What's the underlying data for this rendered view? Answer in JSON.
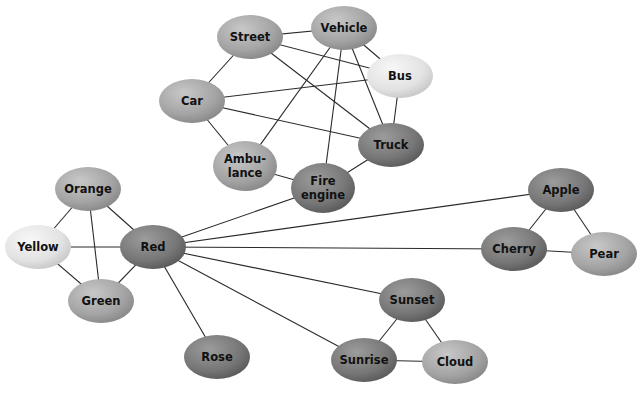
{
  "diagram": {
    "type": "network-graph",
    "shades": {
      "light": "#e4e4e4",
      "medium": "#a8a8a8",
      "dark": "#7a7a7a",
      "edge": "#2a2a2a"
    },
    "nodes": [
      {
        "id": "street",
        "label": [
          "Street"
        ],
        "x": 250,
        "y": 37,
        "shade": "medium"
      },
      {
        "id": "vehicle",
        "label": [
          "Vehicle"
        ],
        "x": 344,
        "y": 28,
        "shade": "medium"
      },
      {
        "id": "bus",
        "label": [
          "Bus"
        ],
        "x": 400,
        "y": 76,
        "shade": "light"
      },
      {
        "id": "car",
        "label": [
          "Car"
        ],
        "x": 192,
        "y": 101,
        "shade": "medium"
      },
      {
        "id": "truck",
        "label": [
          "Truck"
        ],
        "x": 391,
        "y": 145,
        "shade": "dark"
      },
      {
        "id": "ambulance",
        "label": [
          "Ambu-",
          "lance"
        ],
        "x": 245,
        "y": 166,
        "shade": "medium"
      },
      {
        "id": "fire-engine",
        "label": [
          "Fire",
          "engine"
        ],
        "x": 323,
        "y": 188,
        "shade": "dark"
      },
      {
        "id": "orange",
        "label": [
          "Orange"
        ],
        "x": 88,
        "y": 189,
        "shade": "medium"
      },
      {
        "id": "yellow",
        "label": [
          "Yellow"
        ],
        "x": 38,
        "y": 247,
        "shade": "light"
      },
      {
        "id": "red",
        "label": [
          "Red"
        ],
        "x": 153,
        "y": 247,
        "shade": "dark"
      },
      {
        "id": "green",
        "label": [
          "Green"
        ],
        "x": 101,
        "y": 301,
        "shade": "medium"
      },
      {
        "id": "rose",
        "label": [
          "Rose"
        ],
        "x": 217,
        "y": 357,
        "shade": "dark"
      },
      {
        "id": "apple",
        "label": [
          "Apple"
        ],
        "x": 561,
        "y": 190,
        "shade": "dark"
      },
      {
        "id": "cherry",
        "label": [
          "Cherry"
        ],
        "x": 514,
        "y": 249,
        "shade": "dark"
      },
      {
        "id": "pear",
        "label": [
          "Pear"
        ],
        "x": 604,
        "y": 254,
        "shade": "medium"
      },
      {
        "id": "sunset",
        "label": [
          "Sunset"
        ],
        "x": 412,
        "y": 300,
        "shade": "dark"
      },
      {
        "id": "sunrise",
        "label": [
          "Sunrise"
        ],
        "x": 364,
        "y": 360,
        "shade": "dark"
      },
      {
        "id": "cloud",
        "label": [
          "Cloud"
        ],
        "x": 455,
        "y": 362,
        "shade": "medium"
      }
    ],
    "edges": [
      [
        "street",
        "vehicle"
      ],
      [
        "street",
        "bus"
      ],
      [
        "street",
        "truck"
      ],
      [
        "street",
        "car"
      ],
      [
        "vehicle",
        "bus"
      ],
      [
        "vehicle",
        "truck"
      ],
      [
        "vehicle",
        "ambulance"
      ],
      [
        "vehicle",
        "fire-engine"
      ],
      [
        "car",
        "bus"
      ],
      [
        "car",
        "truck"
      ],
      [
        "car",
        "ambulance"
      ],
      [
        "bus",
        "truck"
      ],
      [
        "truck",
        "fire-engine"
      ],
      [
        "ambulance",
        "fire-engine"
      ],
      [
        "red",
        "fire-engine"
      ],
      [
        "red",
        "apple"
      ],
      [
        "red",
        "cherry"
      ],
      [
        "red",
        "sunset"
      ],
      [
        "red",
        "sunrise"
      ],
      [
        "red",
        "rose"
      ],
      [
        "red",
        "orange"
      ],
      [
        "red",
        "yellow"
      ],
      [
        "red",
        "green"
      ],
      [
        "orange",
        "yellow"
      ],
      [
        "orange",
        "green"
      ],
      [
        "yellow",
        "green"
      ],
      [
        "apple",
        "cherry"
      ],
      [
        "apple",
        "pear"
      ],
      [
        "cherry",
        "pear"
      ],
      [
        "sunset",
        "sunrise"
      ],
      [
        "sunset",
        "cloud"
      ],
      [
        "sunrise",
        "cloud"
      ]
    ]
  }
}
